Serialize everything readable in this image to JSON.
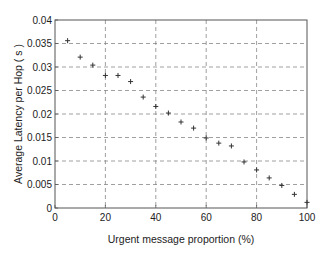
{
  "chart_data": {
    "type": "scatter",
    "title": "",
    "xlabel": "Urgent message proportion (%)",
    "ylabel": "Average Latency per Hop ( s )",
    "xlim": [
      0,
      100
    ],
    "ylim": [
      0,
      0.04
    ],
    "xticks": [
      0,
      20,
      40,
      60,
      80,
      100
    ],
    "xtick_labels": [
      "0",
      "20",
      "40",
      "60",
      "80",
      "100"
    ],
    "yticks": [
      0,
      0.005,
      0.01,
      0.015,
      0.02,
      0.025,
      0.03,
      0.035,
      0.04
    ],
    "ytick_labels": [
      "0",
      "0.005",
      "0.01",
      "0.015",
      "0.02",
      "0.025",
      "0.03",
      "0.035",
      "0.04"
    ],
    "grid": true,
    "grid_style": "dashed",
    "marker": "+",
    "legend": null,
    "series": [
      {
        "name": "Average Latency per Hop",
        "x": [
          5,
          10,
          15,
          20,
          25,
          30,
          35,
          40,
          45,
          50,
          55,
          60,
          65,
          70,
          75,
          80,
          85,
          90,
          95,
          100
        ],
        "y": [
          0.0356,
          0.0321,
          0.0304,
          0.0282,
          0.0282,
          0.0269,
          0.0236,
          0.0216,
          0.0202,
          0.0183,
          0.017,
          0.0149,
          0.0138,
          0.0132,
          0.0098,
          0.0081,
          0.0064,
          0.0048,
          0.0029,
          0.0012
        ]
      }
    ]
  },
  "colors": {
    "axis": "#555555",
    "grid": "#888888",
    "marker": "#333333",
    "text": "#222222"
  }
}
